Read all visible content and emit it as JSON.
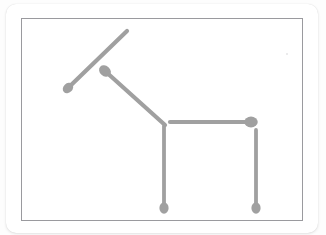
{
  "scene": {
    "title": "Matchstick puzzle figure",
    "description": "Five matchsticks arranged to form a horse-like animal shape",
    "background_color": "#fdfdfd",
    "card_color": "#ffffff",
    "board_border_color": "#9a9a9e",
    "match_color": "#a0a0a0",
    "match_head_color": "#a0a0a0",
    "match_count": 5
  },
  "board": {
    "x": 21,
    "y": 18,
    "width": 282,
    "height": 203
  },
  "matches": [
    {
      "id": "match-1",
      "name": "ear-upper-diagonal",
      "label": "Match 1",
      "head_x": 47,
      "head_y": 70,
      "tip_x": 106,
      "tip_y": 13,
      "thickness": 4.2,
      "head_radius": 4.6
    },
    {
      "id": "match-2",
      "name": "neck-diagonal",
      "label": "Match 2",
      "head_x": 84,
      "head_y": 53,
      "tip_x": 144,
      "tip_y": 107,
      "thickness": 4.2,
      "head_radius": 5.2
    },
    {
      "id": "match-3",
      "name": "back-horizontal",
      "label": "Match 3",
      "head_x": 230,
      "head_y": 104,
      "tip_x": 149,
      "tip_y": 104,
      "thickness": 4.2,
      "head_radius": 5.4
    },
    {
      "id": "match-4",
      "name": "front-leg-vertical",
      "label": "Match 4",
      "head_x": 143,
      "head_y": 190,
      "tip_x": 143,
      "tip_y": 108,
      "thickness": 3.8,
      "head_radius": 4.6
    },
    {
      "id": "match-5",
      "name": "back-leg-vertical",
      "label": "Match 5",
      "head_x": 235,
      "head_y": 190,
      "tip_x": 235,
      "tip_y": 112,
      "thickness": 3.8,
      "head_radius": 4.6
    }
  ],
  "speck": {
    "name": "faint-speck",
    "x": 286,
    "y": 53
  }
}
